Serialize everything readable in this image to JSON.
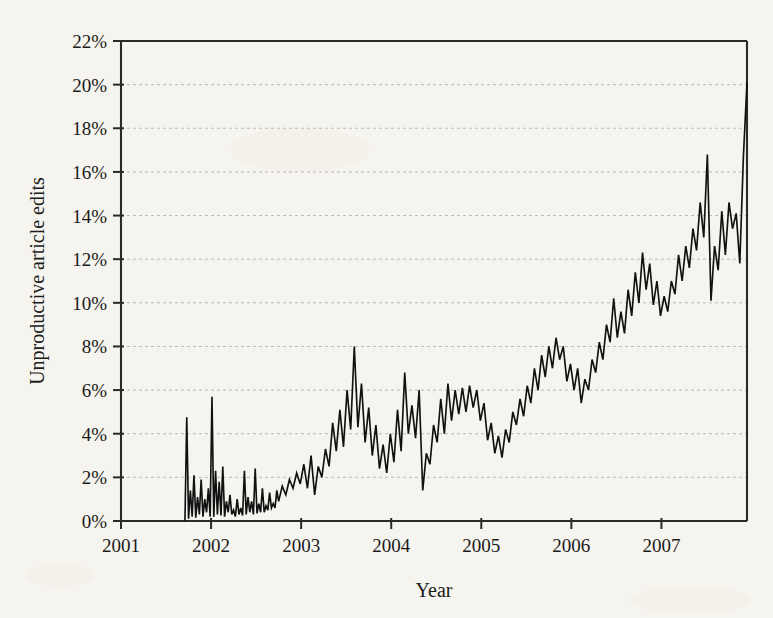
{
  "figure": {
    "background_color": "#fbfaf7",
    "ink_color": "#111111",
    "grid_color": "#b9b9b9",
    "axis_color": "#2a2a2a"
  },
  "labels": {
    "y_axis_title": "Unproductive article edits",
    "x_axis_title": "Year",
    "y_ticks": [
      "0%",
      "2%",
      "4%",
      "6%",
      "8%",
      "10%",
      "12%",
      "14%",
      "16%",
      "18%",
      "20%",
      "22%"
    ],
    "x_ticks": [
      "2001",
      "2002",
      "2003",
      "2004",
      "2005",
      "2006",
      "2007"
    ]
  },
  "chart_data": {
    "type": "line",
    "title": "",
    "subtitle": "",
    "xlabel": "Year",
    "ylabel": "Unproductive article edits",
    "xlim": [
      2001.0,
      2007.95
    ],
    "ylim": [
      0,
      22
    ],
    "y_tick_values": [
      0,
      2,
      4,
      6,
      8,
      10,
      12,
      14,
      16,
      18,
      20,
      22
    ],
    "y_tick_labels": [
      "0%",
      "2%",
      "4%",
      "6%",
      "8%",
      "10%",
      "12%",
      "14%",
      "16%",
      "18%",
      "20%",
      "22%"
    ],
    "x_tick_values": [
      2001,
      2002,
      2003,
      2004,
      2005,
      2006,
      2007
    ],
    "x_tick_labels": [
      "2001",
      "2002",
      "2003",
      "2004",
      "2005",
      "2006",
      "2007"
    ],
    "grid": "horizontal-dashed",
    "legend": "none",
    "annotations": [],
    "y_unit": "percent",
    "series": [
      {
        "name": "Unproductive article edits",
        "color": "#111111",
        "line_width": 1.65,
        "x": [
          2001.71,
          2001.73,
          2001.75,
          2001.77,
          2001.79,
          2001.81,
          2001.83,
          2001.85,
          2001.87,
          2001.89,
          2001.91,
          2001.93,
          2001.95,
          2001.97,
          2001.99,
          2002.01,
          2002.03,
          2002.05,
          2002.07,
          2002.09,
          2002.11,
          2002.13,
          2002.15,
          2002.17,
          2002.19,
          2002.21,
          2002.23,
          2002.25,
          2002.27,
          2002.29,
          2002.31,
          2002.33,
          2002.35,
          2002.37,
          2002.39,
          2002.41,
          2002.43,
          2002.45,
          2002.47,
          2002.49,
          2002.51,
          2002.53,
          2002.55,
          2002.57,
          2002.59,
          2002.61,
          2002.63,
          2002.65,
          2002.67,
          2002.69,
          2002.71,
          2002.73,
          2002.75,
          2002.79,
          2002.83,
          2002.87,
          2002.91,
          2002.95,
          2002.99,
          2003.03,
          2003.07,
          2003.11,
          2003.15,
          2003.19,
          2003.23,
          2003.27,
          2003.31,
          2003.35,
          2003.39,
          2003.43,
          2003.47,
          2003.51,
          2003.55,
          2003.59,
          2003.63,
          2003.67,
          2003.71,
          2003.75,
          2003.79,
          2003.83,
          2003.87,
          2003.91,
          2003.95,
          2003.99,
          2004.03,
          2004.07,
          2004.11,
          2004.15,
          2004.19,
          2004.23,
          2004.27,
          2004.31,
          2004.35,
          2004.39,
          2004.43,
          2004.47,
          2004.51,
          2004.55,
          2004.59,
          2004.63,
          2004.67,
          2004.71,
          2004.75,
          2004.79,
          2004.83,
          2004.87,
          2004.91,
          2004.95,
          2004.99,
          2005.03,
          2005.07,
          2005.11,
          2005.15,
          2005.19,
          2005.23,
          2005.27,
          2005.31,
          2005.35,
          2005.39,
          2005.43,
          2005.47,
          2005.51,
          2005.55,
          2005.59,
          2005.63,
          2005.67,
          2005.71,
          2005.75,
          2005.79,
          2005.83,
          2005.87,
          2005.91,
          2005.95,
          2005.99,
          2006.03,
          2006.07,
          2006.11,
          2006.15,
          2006.19,
          2006.23,
          2006.27,
          2006.31,
          2006.35,
          2006.39,
          2006.43,
          2006.47,
          2006.51,
          2006.55,
          2006.59,
          2006.63,
          2006.67,
          2006.71,
          2006.75,
          2006.79,
          2006.83,
          2006.87,
          2006.91,
          2006.95,
          2006.99,
          2007.03,
          2007.07,
          2007.11,
          2007.15,
          2007.19,
          2007.23,
          2007.27,
          2007.31,
          2007.35,
          2007.39,
          2007.43,
          2007.47,
          2007.51,
          2007.55,
          2007.59,
          2007.63,
          2007.67,
          2007.71,
          2007.75,
          2007.79,
          2007.83,
          2007.87,
          2007.91
        ],
        "y": [
          0.0,
          4.75,
          0.1,
          1.4,
          0.2,
          2.1,
          0.15,
          1.1,
          0.3,
          1.9,
          0.2,
          1.0,
          0.4,
          1.5,
          0.2,
          5.7,
          0.2,
          2.3,
          0.3,
          1.8,
          0.25,
          2.5,
          0.2,
          0.9,
          0.4,
          1.2,
          0.3,
          0.5,
          0.2,
          1.0,
          0.3,
          0.6,
          0.25,
          2.3,
          0.3,
          1.1,
          0.4,
          0.9,
          0.3,
          2.4,
          0.35,
          0.8,
          0.4,
          1.5,
          0.4,
          0.7,
          0.5,
          1.3,
          0.6,
          0.8,
          0.6,
          1.4,
          0.9,
          1.6,
          1.2,
          1.9,
          1.5,
          2.2,
          1.7,
          2.6,
          1.5,
          3.0,
          1.2,
          2.5,
          2.0,
          3.3,
          2.5,
          4.5,
          3.2,
          5.1,
          3.4,
          6.0,
          4.2,
          8.0,
          4.3,
          6.3,
          3.6,
          5.2,
          3.0,
          4.4,
          2.4,
          3.5,
          2.2,
          4.0,
          2.7,
          5.1,
          3.2,
          6.8,
          4.0,
          5.3,
          3.8,
          6.0,
          1.4,
          3.1,
          2.6,
          4.4,
          3.6,
          5.6,
          4.0,
          6.3,
          4.6,
          6.0,
          4.9,
          6.1,
          5.0,
          6.2,
          5.2,
          6.0,
          4.6,
          5.4,
          3.7,
          4.5,
          3.1,
          3.9,
          2.9,
          4.2,
          3.6,
          5.0,
          4.4,
          5.6,
          4.8,
          6.2,
          5.4,
          7.0,
          6.0,
          7.6,
          6.6,
          8.0,
          7.0,
          8.4,
          7.4,
          8.0,
          6.4,
          7.2,
          6.0,
          7.0,
          5.4,
          6.5,
          6.0,
          7.4,
          6.8,
          8.2,
          7.4,
          9.0,
          8.2,
          10.2,
          8.4,
          9.6,
          8.6,
          10.6,
          9.4,
          11.4,
          10.0,
          12.3,
          10.6,
          11.8,
          9.9,
          11.0,
          9.4,
          10.3,
          9.6,
          11.0,
          10.4,
          12.2,
          11.0,
          12.6,
          11.6,
          13.4,
          12.4,
          14.6,
          13.0,
          16.8,
          10.1,
          12.6,
          11.5,
          14.2,
          12.2,
          14.6,
          13.4,
          14.1,
          11.8,
          16.7
        ],
        "note": "Monthly/weekly proportion of article edits classified as unproductive; noisy series rising from near 0% in late 2001 to about 20% by late 2007",
        "start_value": 0.0,
        "end_value": 20.1,
        "max_value": 20.1,
        "min_value": 0.0
      }
    ]
  }
}
